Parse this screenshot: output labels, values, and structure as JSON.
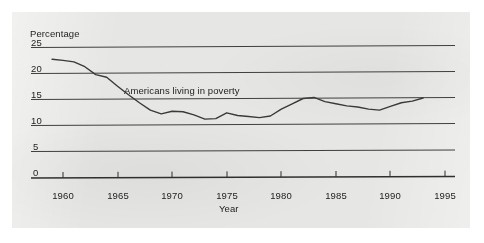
{
  "figure": {
    "panel_bg": "#e6e6e4",
    "ink_color": "#3a3a3a",
    "page_bg": "#ffffff"
  },
  "chart_data": {
    "type": "line",
    "title": "",
    "xlabel": "Year",
    "ylabel": "Percentage",
    "xlim": [
      1958,
      1997
    ],
    "ylim": [
      0,
      25
    ],
    "grid": true,
    "grid_axis": "y",
    "legend": "none",
    "annotations": [
      {
        "text": "Americans living in poverty",
        "x": 1966.5,
        "y": 16.2
      }
    ],
    "x_ticks": [
      1960,
      1965,
      1970,
      1975,
      1980,
      1985,
      1990,
      1995
    ],
    "x_tick_labels": [
      "1960",
      "1965",
      "1970",
      "1975",
      "1980",
      "1985",
      "1990",
      "1995"
    ],
    "y_ticks": [
      0,
      5,
      10,
      15,
      20,
      25
    ],
    "y_tick_labels": [
      "0",
      "5",
      "10",
      "15",
      "20",
      "25"
    ],
    "series": [
      {
        "name": "Americans living in poverty",
        "x": [
          1959,
          1960,
          1961,
          1962,
          1963,
          1964,
          1965,
          1966,
          1967,
          1968,
          1969,
          1970,
          1971,
          1972,
          1973,
          1974,
          1975,
          1976,
          1977,
          1978,
          1979,
          1980,
          1981,
          1982,
          1983,
          1984,
          1985,
          1986,
          1987,
          1988,
          1989,
          1990,
          1991,
          1992,
          1993
        ],
        "values": [
          22.4,
          22.2,
          21.9,
          21.0,
          19.5,
          19.0,
          17.3,
          15.7,
          14.2,
          12.8,
          12.1,
          12.6,
          12.5,
          11.9,
          11.1,
          11.2,
          12.3,
          11.8,
          11.6,
          11.4,
          11.7,
          13.0,
          14.0,
          15.0,
          15.2,
          14.4,
          14.0,
          13.6,
          13.4,
          13.0,
          12.8,
          13.5,
          14.2,
          14.5,
          15.1
        ],
        "line_color": "#3a3a3a",
        "line_width": 1.4,
        "markers": "none"
      }
    ]
  },
  "icons": {
    "chart_type": "line-chart-icon"
  }
}
